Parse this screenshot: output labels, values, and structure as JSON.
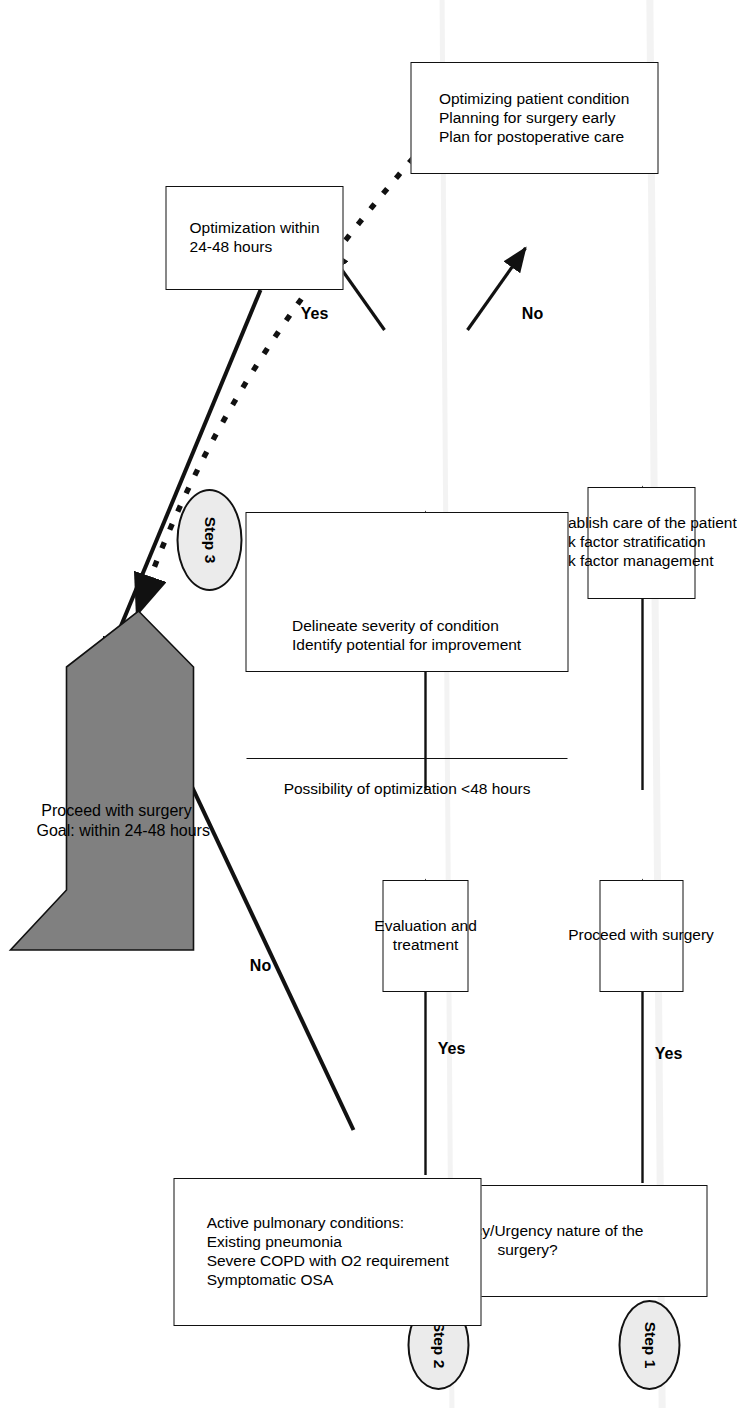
{
  "diagram": {
    "orientation_deg": 90,
    "colors": {
      "stroke": "#111111",
      "box_fill": "#ffffff",
      "step_ellipse_fill": "#ebebeb",
      "goal_arrow_fill": "#808080",
      "text": "#000000"
    }
  },
  "steps": [
    {
      "id": "step1",
      "label": "Step 1"
    },
    {
      "id": "step2",
      "label": "Step 2"
    },
    {
      "id": "step3",
      "label": "Step 3"
    }
  ],
  "nodes": {
    "emergency": {
      "name": "emergency-urgency-box",
      "lines": [
        "Emergency/Urgency nature of the",
        "surgery?"
      ]
    },
    "proceed_surgery": {
      "name": "proceed-with-surgery-box",
      "lines": [
        "Proceed with surgery"
      ]
    },
    "establish_care": {
      "name": "establish-care-box",
      "lines": [
        "Establish care of the patient",
        "Risk factor stratification",
        "Risk factor management"
      ]
    },
    "active_pulmonary": {
      "name": "active-pulmonary-conditions-box",
      "lines": [
        "Active pulmonary conditions:",
        "Existing pneumonia",
        "Severe COPD with O2 requirement",
        "Symptomatic OSA"
      ]
    },
    "evaluation_treatment": {
      "name": "evaluation-and-treatment-box",
      "lines": [
        "Evaluation and",
        "treatment"
      ]
    },
    "delineate": {
      "name": "delineate-severity-box",
      "top_lines": [
        "Delineate severity of condition",
        "Identify potential for improvement"
      ],
      "bottom_lines": [
        "Possibility of optimization <48 hours"
      ]
    },
    "optimizing_condition": {
      "name": "optimizing-patient-condition-box",
      "lines": [
        "Optimizing patient condition",
        "Planning for surgery early",
        "Plan for postoperative care"
      ]
    },
    "optimization_window": {
      "name": "optimization-within-24-48-hours-box",
      "lines": [
        "Optimization within",
        "24-48 hours"
      ]
    },
    "goal_arrow": {
      "name": "proceed-with-surgery-goal-arrow",
      "lines": [
        "Proceed with surgery",
        "Goal: within 24-48 hours"
      ]
    }
  },
  "edge_labels": {
    "emergency_yes": "Yes",
    "pulmonary_yes": "Yes",
    "pulmonary_no": "No",
    "optimization_yes": "Yes",
    "optimization_no": "No"
  }
}
